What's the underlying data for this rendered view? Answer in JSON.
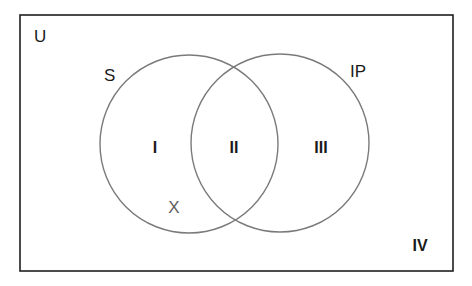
{
  "diagram": {
    "type": "venn",
    "universe": {
      "label": "U"
    },
    "sets": [
      {
        "id": "S",
        "label": "S"
      },
      {
        "id": "IP",
        "label": "IP"
      }
    ],
    "regions": [
      {
        "label": "I",
        "description": "S only"
      },
      {
        "label": "II",
        "description": "S and IP"
      },
      {
        "label": "III",
        "description": "IP only"
      },
      {
        "label": "IV",
        "description": "outside both"
      }
    ],
    "marker": {
      "label": "X",
      "region": "I"
    },
    "colors": {
      "frame": "#1e1e1e",
      "circle_stroke": "#7a7a7a",
      "text": "#1a1a1a",
      "marker": "#606060",
      "background": "#ffffff"
    }
  }
}
